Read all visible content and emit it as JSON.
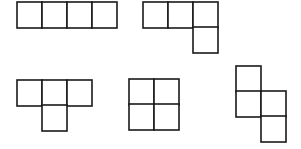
{
  "diagram": {
    "title": "",
    "stroke_color": "#1a1a1a",
    "fill_color": "#ffffff",
    "cell_size": 25,
    "pieces": [
      {
        "name": "I-tetromino",
        "origin": [
          17,
          2
        ],
        "cells": [
          [
            0,
            0
          ],
          [
            1,
            0
          ],
          [
            2,
            0
          ],
          [
            3,
            0
          ]
        ]
      },
      {
        "name": "L-tetromino",
        "origin": [
          143,
          2
        ],
        "cells": [
          [
            0,
            0
          ],
          [
            1,
            0
          ],
          [
            2,
            0
          ],
          [
            2,
            1
          ]
        ]
      },
      {
        "name": "T-tetromino",
        "origin": [
          17,
          80
        ],
        "cells": [
          [
            0,
            0
          ],
          [
            1,
            0
          ],
          [
            2,
            0
          ],
          [
            1,
            1
          ]
        ]
      },
      {
        "name": "O-tetromino",
        "origin": [
          129,
          79
        ],
        "cells": [
          [
            0,
            0
          ],
          [
            1,
            0
          ],
          [
            0,
            1
          ],
          [
            1,
            1
          ]
        ]
      },
      {
        "name": "S-tetromino",
        "origin": [
          236,
          66
        ],
        "cells": [
          [
            0,
            0
          ],
          [
            0,
            1
          ],
          [
            1,
            1
          ],
          [
            1,
            2
          ]
        ]
      }
    ]
  }
}
